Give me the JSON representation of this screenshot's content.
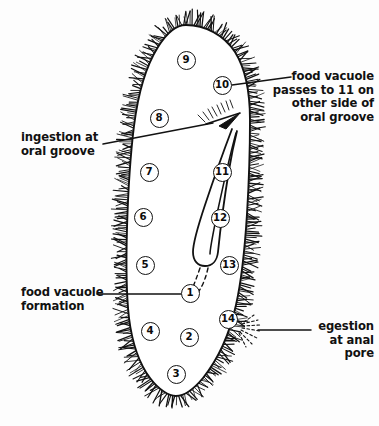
{
  "figure": {
    "organism": "paramecium",
    "background_color": "#fdfdfd",
    "ink_color": "#111111"
  },
  "annotations": {
    "ingestion": {
      "text": "ingestion at\noral groove",
      "align": "left"
    },
    "food_vacuole_formation": {
      "text": "food vacuole\nformation",
      "align": "left"
    },
    "food_vacuole_passes": {
      "text": "food vacuole\npasses to 11 on\nother side of\noral groove",
      "align": "right"
    },
    "egestion": {
      "text": "egestion\nat anal\npore",
      "align": "right"
    }
  },
  "stage_markers": [
    {
      "id": "1",
      "label": "1",
      "x": 190,
      "y": 293
    },
    {
      "id": "2",
      "label": "2",
      "x": 189,
      "y": 337
    },
    {
      "id": "3",
      "label": "3",
      "x": 176,
      "y": 374
    },
    {
      "id": "4",
      "label": "4",
      "x": 150,
      "y": 331
    },
    {
      "id": "5",
      "label": "5",
      "x": 145,
      "y": 265
    },
    {
      "id": "6",
      "label": "6",
      "x": 143,
      "y": 217
    },
    {
      "id": "7",
      "label": "7",
      "x": 149,
      "y": 172
    },
    {
      "id": "8",
      "label": "8",
      "x": 159,
      "y": 118
    },
    {
      "id": "9",
      "label": "9",
      "x": 186,
      "y": 60
    },
    {
      "id": "10",
      "label": "10",
      "x": 222,
      "y": 85
    },
    {
      "id": "11",
      "label": "11",
      "x": 222,
      "y": 172
    },
    {
      "id": "12",
      "label": "12",
      "x": 220,
      "y": 218
    },
    {
      "id": "13",
      "label": "13",
      "x": 229,
      "y": 265
    },
    {
      "id": "14",
      "label": "14",
      "x": 228,
      "y": 319
    }
  ]
}
